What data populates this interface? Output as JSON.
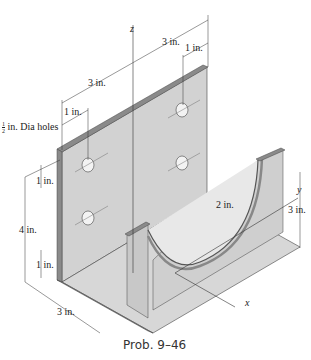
{
  "figure": {
    "caption": "Prob. 9–46",
    "axes": {
      "x": "x",
      "y": "y",
      "z": "z"
    },
    "dimensions": {
      "top_span_left": "3 in.",
      "top_span_right": "3 in.",
      "top_right_offset": "1 in.",
      "left_offset": "1 in.",
      "hole_label_num": "1",
      "hole_label_den": "2",
      "hole_label_text": " in. Dia holes",
      "left_hole_spacing": "1 in.",
      "left_height": "4 in.",
      "left_bottom_offset": "1 in.",
      "base_width": "3 in.",
      "right_height": "3 in.",
      "radius": "2 in."
    },
    "colors": {
      "plate_face": "#cfcfcf",
      "plate_edge": "#7a7a7a",
      "line": "#333333",
      "background": "#ffffff"
    }
  }
}
